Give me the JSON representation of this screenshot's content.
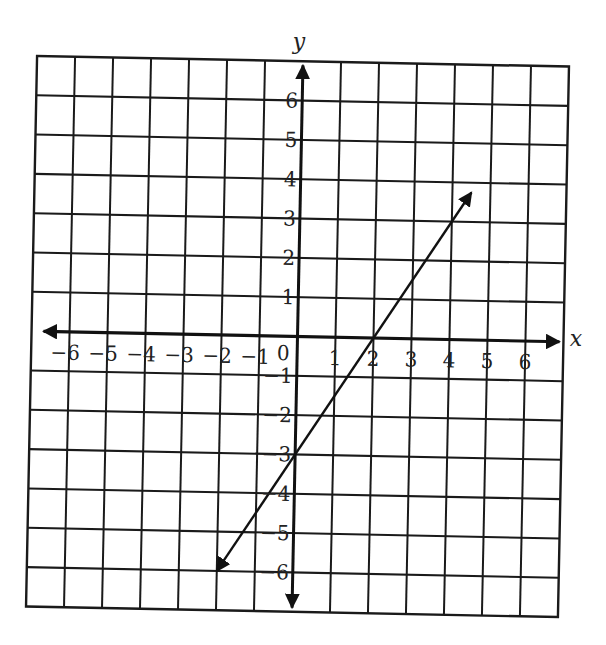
{
  "chart_data": {
    "type": "line",
    "title": "",
    "xlabel": "x",
    "ylabel": "y",
    "xlim": [
      -7,
      7
    ],
    "ylim": [
      -7,
      7
    ],
    "grid": true,
    "x_ticks": [
      -6,
      -5,
      -4,
      -3,
      -2,
      -1,
      0,
      1,
      2,
      3,
      4,
      5,
      6
    ],
    "y_ticks": [
      -6,
      -5,
      -4,
      -3,
      -2,
      -1,
      1,
      2,
      3,
      4,
      5,
      6
    ],
    "x_tick_labels": [
      "−6",
      "−5",
      "−4",
      "−3",
      "−2",
      "−1",
      "0",
      "1",
      "2",
      "3",
      "4",
      "5",
      "6"
    ],
    "y_tick_labels": [
      "−6",
      "−5",
      "−4",
      "−3",
      "−2",
      "−1",
      "1",
      "2",
      "3",
      "4",
      "5",
      "6"
    ],
    "series": [
      {
        "name": "line",
        "equation": "y = 1.5x - 3",
        "slope": 1.5,
        "y_intercept": -3,
        "x_intercept": 2,
        "x": [
          -2,
          0,
          2,
          4.5
        ],
        "y": [
          -6,
          -3,
          0,
          3.75
        ],
        "arrows": "both ends"
      }
    ],
    "legend": null
  },
  "labels": {
    "x_axis": "x",
    "y_axis": "y",
    "origin": "0"
  },
  "colors": {
    "ink": "#1a1a1a",
    "background": "#ffffff"
  }
}
